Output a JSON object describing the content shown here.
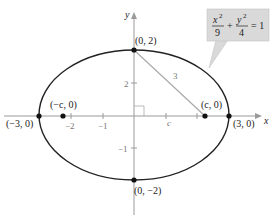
{
  "diagram": {
    "equation": {
      "x_num": "x",
      "x_exp": "2",
      "x_den": "9",
      "plus": "+",
      "y_num": "y",
      "y_exp": "2",
      "y_den": "4",
      "equals": "= 1",
      "box_color": "#d9d9d9"
    },
    "axes": {
      "x_label": "x",
      "y_label": "y",
      "x_ticks": [
        "−2",
        "−1"
      ],
      "y_ticks": [
        "2",
        "−1"
      ]
    },
    "points": {
      "top": "(0, 2)",
      "bottom": "(0, −2)",
      "right": "(3, 0)",
      "left": "(−3, 0)",
      "focus_right": "(c, 0)",
      "focus_left": "(−c, 0)"
    },
    "segment_label": "3",
    "c_label": "c",
    "colors": {
      "curve": "#222222",
      "axis": "#999999",
      "segment": "#aaaaaa"
    }
  }
}
